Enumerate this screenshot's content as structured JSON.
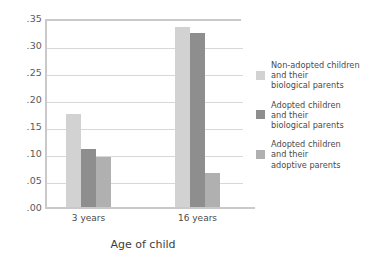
{
  "chart_data": {
    "type": "bar",
    "title": "",
    "xlabel": "Age of child",
    "ylabel": "",
    "categories": [
      "3 years",
      "16 years"
    ],
    "ylim": [
      0.0,
      0.35
    ],
    "ytick_labels": [
      ".35",
      ".30",
      ".25",
      ".20",
      ".15",
      ".10",
      ".05",
      ".00"
    ],
    "ytick_values": [
      0.35,
      0.3,
      0.25,
      0.2,
      0.15,
      0.1,
      0.05,
      0.0
    ],
    "grid": true,
    "legend_position": "right",
    "series": [
      {
        "name": "Non-adopted children\nand their\nbiological parents",
        "color": "#d2d2d2",
        "values": [
          0.175,
          0.335
        ]
      },
      {
        "name": "Adopted children\nand their\nbiological parents",
        "color": "#8e8e8e",
        "values": [
          0.11,
          0.325
        ]
      },
      {
        "name": "Adopted children\nand  their\nadoptive parents",
        "color": "#b0b0b0",
        "values": [
          0.095,
          0.065
        ]
      }
    ]
  },
  "colors": {
    "background": "#ffffff",
    "gridline": "#d8d8d8",
    "axis": "#c9c9c9",
    "text": "#4a4a4a"
  }
}
